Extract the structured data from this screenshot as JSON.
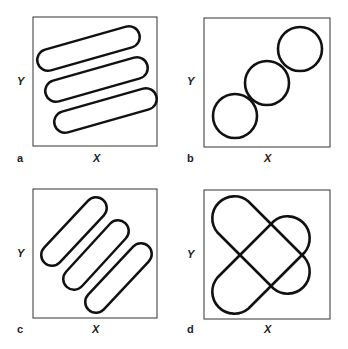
{
  "panels": [
    {
      "id": "a",
      "label": "a",
      "xlabel": "X",
      "ylabel": "Y",
      "shape": "three parallel shallow-slope capsules"
    },
    {
      "id": "b",
      "label": "b",
      "xlabel": "X",
      "ylabel": "Y",
      "shape": "three touching circles along diagonal"
    },
    {
      "id": "c",
      "label": "c",
      "xlabel": "X",
      "ylabel": "Y",
      "shape": "three parallel steep diagonal capsules"
    },
    {
      "id": "d",
      "label": "d",
      "xlabel": "X",
      "ylabel": "Y",
      "shape": "two crossing capsules forming an X"
    }
  ],
  "colors": {
    "stroke": "#111111",
    "box": "#333333",
    "background": "#ffffff"
  }
}
